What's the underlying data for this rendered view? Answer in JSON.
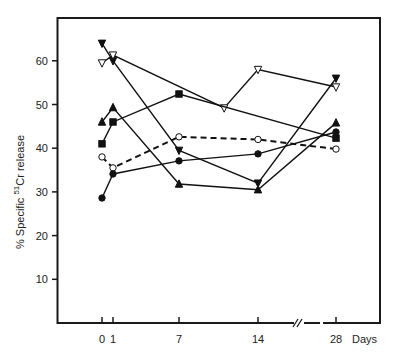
{
  "chart_data": {
    "type": "line",
    "title": "",
    "xlabel": "Days",
    "ylabel": "% Specific 51Cr release",
    "ylabel_parts": {
      "prefix": "% Specific ",
      "superscript": "51",
      "suffix": "Cr release"
    },
    "x_ticks": [
      0,
      1,
      7,
      14,
      28
    ],
    "x_tick_labels": [
      "0",
      "1",
      "7",
      "14",
      "28"
    ],
    "y_ticks": [
      10,
      20,
      30,
      40,
      50,
      60
    ],
    "y_tick_labels": [
      "10",
      "20",
      "30",
      "40",
      "50",
      "60"
    ],
    "ylim": [
      0,
      70
    ],
    "axis_break": "between 14 and 28 on x-axis (//)",
    "grid": false,
    "legend": "none",
    "series": [
      {
        "name": "filled-down-triangle",
        "marker": "down-triangle-filled",
        "dashed": false,
        "points": [
          [
            0,
            64
          ],
          [
            1,
            60
          ],
          [
            7,
            39.5
          ],
          [
            14,
            32
          ],
          [
            28,
            56
          ]
        ]
      },
      {
        "name": "open-down-triangle",
        "marker": "down-triangle-open",
        "dashed": false,
        "points": [
          [
            0,
            59.5
          ],
          [
            1,
            61.3
          ],
          [
            11,
            49.2
          ],
          [
            14,
            58
          ],
          [
            28,
            54
          ]
        ]
      },
      {
        "name": "filled-up-triangle",
        "marker": "up-triangle-filled",
        "dashed": false,
        "points": [
          [
            0,
            46
          ],
          [
            1,
            49.3
          ],
          [
            7,
            31.8
          ],
          [
            14,
            30.5
          ],
          [
            28,
            45.8
          ]
        ]
      },
      {
        "name": "filled-square",
        "marker": "square-filled",
        "dashed": false,
        "points": [
          [
            0,
            41
          ],
          [
            1,
            46
          ],
          [
            7,
            52.4
          ],
          [
            28,
            42.3
          ]
        ]
      },
      {
        "name": "open-circle",
        "marker": "circle-open",
        "dashed": true,
        "points": [
          [
            0,
            38
          ],
          [
            1,
            35.5
          ],
          [
            7,
            42.6
          ],
          [
            14,
            42
          ],
          [
            28,
            39.8
          ]
        ]
      },
      {
        "name": "filled-circle",
        "marker": "circle-filled",
        "dashed": false,
        "points": [
          [
            0,
            28.6
          ],
          [
            1,
            34.1
          ],
          [
            7,
            37.1
          ],
          [
            14,
            38.7
          ],
          [
            28,
            43.7
          ]
        ]
      }
    ]
  }
}
